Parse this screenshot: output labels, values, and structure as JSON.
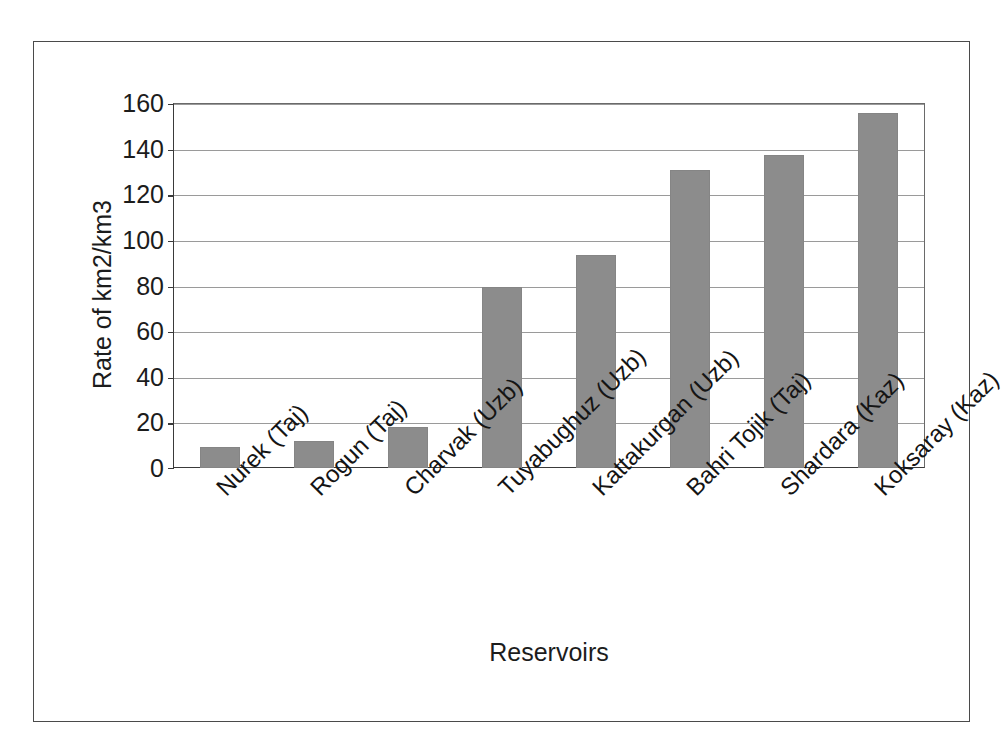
{
  "chart_data": {
    "type": "bar",
    "title": "",
    "xlabel": "Reservoirs",
    "ylabel": "Rate of km2/km3",
    "categories": [
      "Nurek (Taj)",
      "Rogun (Taj)",
      "Charvak (Uzb)",
      "Tuyabughuz (Uzb)",
      "Kattakurgan (Uzb)",
      "Bahri Tojik (Taj)",
      "Shardara (Kaz)",
      "Koksaray (Kaz)"
    ],
    "values": [
      9,
      12,
      18,
      79.5,
      93.5,
      130.5,
      137,
      155.5
    ],
    "ylim": [
      0,
      160
    ],
    "ytick_labels": [
      "160",
      "140",
      "120",
      "100",
      "80",
      "60",
      "40",
      "20",
      "0"
    ],
    "ytick_values": [
      160,
      140,
      120,
      100,
      80,
      60,
      40,
      20,
      0
    ],
    "ytick_step": 20,
    "grid": true,
    "grid_axis": "y",
    "legend": "none",
    "bar_color": "#8c8c8c",
    "axis_color": "#3a3a3a",
    "grid_color": "#9a9a9a",
    "background_color": "#ffffff",
    "xtick_label_rotation": -45
  }
}
